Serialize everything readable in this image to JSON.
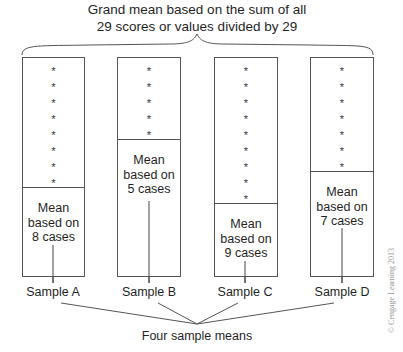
{
  "title": {
    "line1": "Grand mean based on the sum of all",
    "line2": "29 scores or values divided by 29"
  },
  "samples": [
    {
      "name": "Sample A",
      "cases": 8,
      "mean_line1": "Mean",
      "mean_line2": "based on",
      "mean_line3": "8 cases"
    },
    {
      "name": "Sample B",
      "cases": 5,
      "mean_line1": "Mean",
      "mean_line2": "based on",
      "mean_line3": "5 cases"
    },
    {
      "name": "Sample C",
      "cases": 9,
      "mean_line1": "Mean",
      "mean_line2": "based on",
      "mean_line3": "9 cases"
    },
    {
      "name": "Sample D",
      "cases": 7,
      "mean_line1": "Mean",
      "mean_line2": "based on",
      "mean_line3": "7 cases"
    }
  ],
  "star_symbol": "*",
  "footer": "Four sample means",
  "copyright": "© Cengage Learning 2013"
}
